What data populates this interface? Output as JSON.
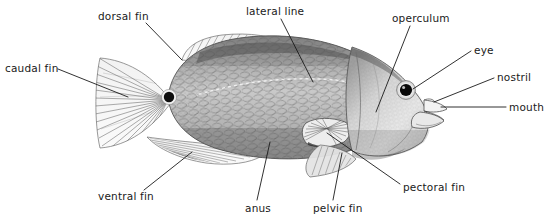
{
  "diagram": {
    "background_color": "#ffffff",
    "ink_color": "#1a1a1a",
    "width": 546,
    "height": 217
  },
  "labels": [
    {
      "id": "dorsal-fin",
      "text": "dorsal fin",
      "text_x": 98,
      "text_y": 20,
      "anchor": "start",
      "leader": [
        [
          146,
          23
        ],
        [
          182,
          60
        ]
      ]
    },
    {
      "id": "lateral-line",
      "text": "lateral line",
      "text_x": 246,
      "text_y": 15,
      "anchor": "start",
      "leader": [
        [
          281,
          19
        ],
        [
          313,
          82
        ]
      ]
    },
    {
      "id": "operculum",
      "text": "operculum",
      "text_x": 392,
      "text_y": 22,
      "anchor": "start",
      "leader": [
        [
          410,
          26
        ],
        [
          376,
          112
        ]
      ]
    },
    {
      "id": "caudal-fin",
      "text": "caudal fin",
      "text_x": 5,
      "text_y": 72,
      "anchor": "start",
      "leader": [
        [
          58,
          69
        ],
        [
          128,
          97
        ]
      ]
    },
    {
      "id": "eye",
      "text": "eye",
      "text_x": 474,
      "text_y": 54,
      "anchor": "start",
      "leader": [
        [
          471,
          51
        ],
        [
          413,
          89
        ]
      ]
    },
    {
      "id": "nostril",
      "text": "nostril",
      "text_x": 497,
      "text_y": 81,
      "anchor": "start",
      "leader": [
        [
          494,
          78
        ],
        [
          434,
          102
        ]
      ]
    },
    {
      "id": "mouth",
      "text": "mouth",
      "text_x": 509,
      "text_y": 111,
      "anchor": "start",
      "leader": [
        [
          506,
          107
        ],
        [
          441,
          107
        ]
      ]
    },
    {
      "id": "ventral-fin",
      "text": "ventral fin",
      "text_x": 98,
      "text_y": 200,
      "anchor": "start",
      "leader": [
        [
          144,
          190
        ],
        [
          192,
          152
        ]
      ]
    },
    {
      "id": "anus",
      "text": "anus",
      "text_x": 245,
      "text_y": 212,
      "anchor": "start",
      "leader": [
        [
          257,
          200
        ],
        [
          270,
          142
        ]
      ]
    },
    {
      "id": "pelvic-fin",
      "text": "pelvic fin",
      "text_x": 313,
      "text_y": 212,
      "anchor": "start",
      "leader": [
        [
          333,
          200
        ],
        [
          342,
          153
        ]
      ]
    },
    {
      "id": "pectoral-fin",
      "text": "pectoral fin",
      "text_x": 403,
      "text_y": 191,
      "anchor": "start",
      "leader": [
        [
          400,
          184
        ],
        [
          327,
          133
        ]
      ]
    }
  ]
}
